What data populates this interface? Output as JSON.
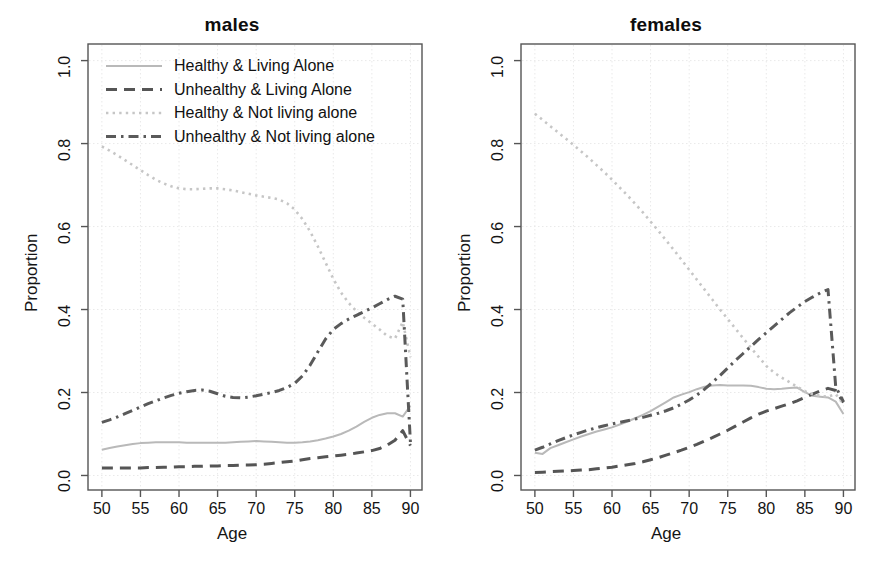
{
  "figure": {
    "background": "#ffffff",
    "axis_color": "#555555",
    "grid_color": "#e9e9e9",
    "text_color": "#141414"
  },
  "panels": [
    {
      "id": "males",
      "title": "males"
    },
    {
      "id": "females",
      "title": "females"
    }
  ],
  "axes": {
    "xlabel": "Age",
    "ylabel": "Proportion",
    "xlim": [
      48.2,
      91.5
    ],
    "ylim": [
      -0.035,
      1.04
    ],
    "xticks": [
      50,
      55,
      60,
      65,
      70,
      75,
      80,
      85,
      90
    ],
    "xticklabels": [
      "50",
      "55",
      "60",
      "65",
      "70",
      "75",
      "80",
      "85",
      "90"
    ],
    "yticks": [
      0.0,
      0.2,
      0.4,
      0.6,
      0.8,
      1.0
    ],
    "yticklabels": [
      "0.0",
      "0.2",
      "0.4",
      "0.6",
      "0.8",
      "1.0"
    ],
    "grid": true
  },
  "legend": {
    "position": "top-left-inside-males-panel",
    "entries": [
      {
        "label": "Healthy & Living Alone",
        "style": "solid",
        "color": "#b9b9b9"
      },
      {
        "label": "Unhealthy & Living Alone",
        "style": "dashed",
        "color": "#555555"
      },
      {
        "label": "Healthy & Not living alone",
        "style": "dotted",
        "color": "#c6c6c6"
      },
      {
        "label": "Unhealthy & Not living alone",
        "style": "dashdot",
        "color": "#5a5a5a"
      }
    ]
  },
  "chart_data": [
    {
      "type": "line",
      "title": "males",
      "xlabel": "Age",
      "ylabel": "Proportion",
      "xlim": [
        48.2,
        91.5
      ],
      "ylim": [
        -0.035,
        1.04
      ],
      "grid": true,
      "x": [
        50,
        51,
        52,
        53,
        54,
        55,
        56,
        57,
        58,
        59,
        60,
        61,
        62,
        63,
        64,
        65,
        66,
        67,
        68,
        69,
        70,
        71,
        72,
        73,
        74,
        75,
        76,
        77,
        78,
        79,
        80,
        81,
        82,
        83,
        84,
        85,
        86,
        87,
        88,
        89,
        90
      ],
      "series": [
        {
          "name": "Healthy & Living Alone",
          "style": "solid",
          "color": "#b9b9b9",
          "values": [
            0.062,
            0.066,
            0.07,
            0.073,
            0.076,
            0.078,
            0.079,
            0.08,
            0.08,
            0.08,
            0.08,
            0.079,
            0.079,
            0.079,
            0.079,
            0.079,
            0.079,
            0.08,
            0.081,
            0.082,
            0.083,
            0.082,
            0.081,
            0.08,
            0.079,
            0.079,
            0.08,
            0.082,
            0.085,
            0.089,
            0.094,
            0.1,
            0.108,
            0.118,
            0.129,
            0.139,
            0.146,
            0.15,
            0.15,
            0.142,
            0.168
          ]
        },
        {
          "name": "Unhealthy & Living Alone",
          "style": "dashed",
          "color": "#555555",
          "values": [
            0.018,
            0.018,
            0.018,
            0.018,
            0.018,
            0.018,
            0.019,
            0.019,
            0.02,
            0.02,
            0.021,
            0.021,
            0.022,
            0.022,
            0.023,
            0.023,
            0.024,
            0.024,
            0.025,
            0.025,
            0.026,
            0.027,
            0.029,
            0.031,
            0.033,
            0.035,
            0.038,
            0.041,
            0.043,
            0.045,
            0.047,
            0.049,
            0.051,
            0.054,
            0.057,
            0.06,
            0.065,
            0.073,
            0.085,
            0.108,
            0.072
          ]
        },
        {
          "name": "Healthy & Not living alone",
          "style": "dotted",
          "color": "#c6c6c6",
          "values": [
            0.793,
            0.783,
            0.772,
            0.76,
            0.748,
            0.736,
            0.724,
            0.713,
            0.704,
            0.697,
            0.692,
            0.69,
            0.69,
            0.691,
            0.692,
            0.692,
            0.69,
            0.687,
            0.683,
            0.679,
            0.675,
            0.672,
            0.669,
            0.665,
            0.656,
            0.641,
            0.618,
            0.588,
            0.552,
            0.513,
            0.474,
            0.441,
            0.416,
            0.396,
            0.38,
            0.366,
            0.352,
            0.336,
            0.33,
            0.37,
            0.285
          ]
        },
        {
          "name": "Unhealthy & Not living alone",
          "style": "dashdot",
          "color": "#5a5a5a",
          "values": [
            0.128,
            0.134,
            0.141,
            0.149,
            0.157,
            0.165,
            0.173,
            0.18,
            0.187,
            0.193,
            0.198,
            0.202,
            0.205,
            0.206,
            0.203,
            0.197,
            0.191,
            0.188,
            0.187,
            0.189,
            0.192,
            0.196,
            0.2,
            0.205,
            0.212,
            0.222,
            0.24,
            0.266,
            0.298,
            0.329,
            0.352,
            0.366,
            0.377,
            0.386,
            0.395,
            0.404,
            0.414,
            0.424,
            0.432,
            0.425,
            0.08
          ]
        }
      ]
    },
    {
      "type": "line",
      "title": "females",
      "xlabel": "Age",
      "ylabel": "Proportion",
      "xlim": [
        48.2,
        91.5
      ],
      "ylim": [
        -0.035,
        1.04
      ],
      "grid": true,
      "x": [
        50,
        51,
        52,
        53,
        54,
        55,
        56,
        57,
        58,
        59,
        60,
        61,
        62,
        63,
        64,
        65,
        66,
        67,
        68,
        69,
        70,
        71,
        72,
        73,
        74,
        75,
        76,
        77,
        78,
        79,
        80,
        81,
        82,
        83,
        84,
        85,
        86,
        87,
        88,
        89,
        90
      ],
      "series": [
        {
          "name": "Healthy & Living Alone",
          "style": "solid",
          "color": "#b9b9b9",
          "values": [
            0.055,
            0.052,
            0.066,
            0.073,
            0.08,
            0.087,
            0.094,
            0.1,
            0.106,
            0.111,
            0.116,
            0.123,
            0.13,
            0.138,
            0.146,
            0.155,
            0.166,
            0.177,
            0.188,
            0.195,
            0.201,
            0.208,
            0.214,
            0.217,
            0.218,
            0.217,
            0.217,
            0.217,
            0.216,
            0.213,
            0.209,
            0.208,
            0.209,
            0.211,
            0.212,
            0.201,
            0.192,
            0.19,
            0.188,
            0.178,
            0.148
          ]
        },
        {
          "name": "Unhealthy & Living Alone",
          "style": "dashed",
          "color": "#555555",
          "values": [
            0.007,
            0.008,
            0.009,
            0.01,
            0.011,
            0.012,
            0.013,
            0.014,
            0.016,
            0.018,
            0.02,
            0.023,
            0.026,
            0.029,
            0.033,
            0.038,
            0.043,
            0.049,
            0.055,
            0.061,
            0.068,
            0.075,
            0.083,
            0.091,
            0.1,
            0.109,
            0.119,
            0.129,
            0.139,
            0.148,
            0.155,
            0.161,
            0.167,
            0.173,
            0.18,
            0.188,
            0.196,
            0.204,
            0.21,
            0.205,
            0.176
          ]
        },
        {
          "name": "Healthy & Not living alone",
          "style": "dotted",
          "color": "#c6c6c6",
          "values": [
            0.872,
            0.857,
            0.842,
            0.827,
            0.812,
            0.797,
            0.781,
            0.765,
            0.748,
            0.731,
            0.713,
            0.694,
            0.675,
            0.655,
            0.634,
            0.612,
            0.59,
            0.567,
            0.544,
            0.52,
            0.496,
            0.472,
            0.448,
            0.424,
            0.4,
            0.377,
            0.354,
            0.331,
            0.308,
            0.286,
            0.264,
            0.248,
            0.236,
            0.225,
            0.214,
            0.203,
            0.196,
            0.192,
            0.19,
            0.196,
            0.172
          ]
        },
        {
          "name": "Unhealthy & Not living alone",
          "style": "dashdot",
          "color": "#5a5a5a",
          "values": [
            0.061,
            0.068,
            0.076,
            0.084,
            0.091,
            0.098,
            0.104,
            0.11,
            0.115,
            0.12,
            0.124,
            0.128,
            0.132,
            0.136,
            0.14,
            0.145,
            0.15,
            0.156,
            0.163,
            0.172,
            0.182,
            0.194,
            0.208,
            0.224,
            0.241,
            0.259,
            0.277,
            0.294,
            0.311,
            0.328,
            0.344,
            0.36,
            0.376,
            0.392,
            0.406,
            0.419,
            0.43,
            0.44,
            0.448,
            0.214,
            0.178
          ]
        }
      ]
    }
  ]
}
